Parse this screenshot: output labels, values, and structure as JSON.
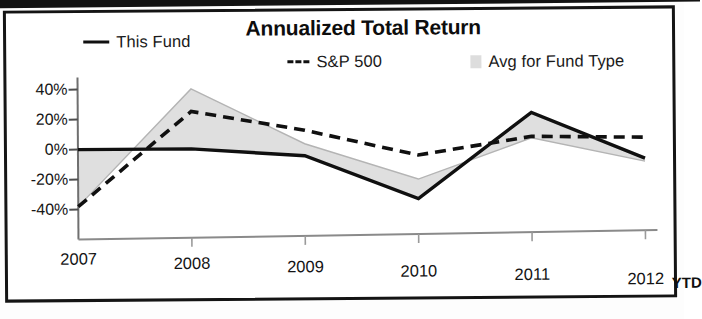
{
  "chart_data": {
    "type": "line",
    "title": "Annualized Total Return",
    "xlabel": "",
    "ylabel": "",
    "ylim": [
      -48,
      46
    ],
    "yticks": [
      40,
      20,
      0,
      -20,
      -40
    ],
    "ytick_labels": [
      "40%",
      "20%",
      "0%",
      "-20%",
      "-40%"
    ],
    "categories": [
      "2007",
      "2008",
      "2009",
      "2010",
      "2011",
      "2012"
    ],
    "x_note": "YTD",
    "grid": false,
    "legend_position": "top",
    "series": [
      {
        "name": "This Fund",
        "style": "solid",
        "color": "#101010",
        "values": [
          0,
          0,
          -5,
          -34,
          23,
          -8
        ]
      },
      {
        "name": "S&P 500",
        "style": "dashed",
        "color": "#101010",
        "values": [
          -38,
          25,
          12,
          -5,
          7,
          6
        ]
      },
      {
        "name": "Avg for Fund Type",
        "style": "area",
        "color": "#d9d9d9",
        "values": [
          -38,
          40,
          3,
          -21,
          6,
          -10
        ]
      }
    ]
  },
  "chart": {
    "title": "Annualized Total Return",
    "legend": [
      {
        "label": "This Fund",
        "swatch": "solid-line-swatch"
      },
      {
        "label": "S&P 500",
        "swatch": "dashed-line-swatch"
      },
      {
        "label": "Avg for Fund Type",
        "swatch": "gray-area-swatch"
      }
    ],
    "y_axis": {
      "labels": [
        "40%",
        "20%",
        "0%",
        "-20%",
        "-40%"
      ]
    },
    "x_axis": {
      "labels": [
        "2007",
        "2008",
        "2009",
        "2010",
        "2011",
        "2012"
      ],
      "suffix": "YTD"
    }
  }
}
